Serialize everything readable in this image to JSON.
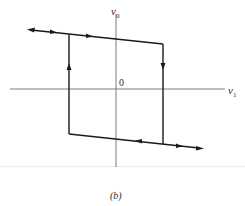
{
  "figure": {
    "caption": "(b)",
    "axes": {
      "x_label": "v",
      "x_subscript": "1",
      "y_label": "v",
      "y_subscript": "0",
      "origin_label": "0"
    },
    "loop": {
      "upper_line": {
        "from": [
          10,
          29
        ],
        "to": [
          163,
          44
        ]
      },
      "lower_line": {
        "from": [
          69,
          134
        ],
        "to": [
          203,
          148
        ]
      },
      "left_edge": {
        "x": 69,
        "y_top": 35,
        "y_bottom": 134,
        "arrow": "up"
      },
      "right_edge": {
        "x": 163,
        "y_top": 44,
        "y_bottom": 144,
        "arrow": "down"
      }
    },
    "colors": {
      "line": "#1a1a1a",
      "axis": "#6e6e6e",
      "background": "#ffffff"
    }
  }
}
